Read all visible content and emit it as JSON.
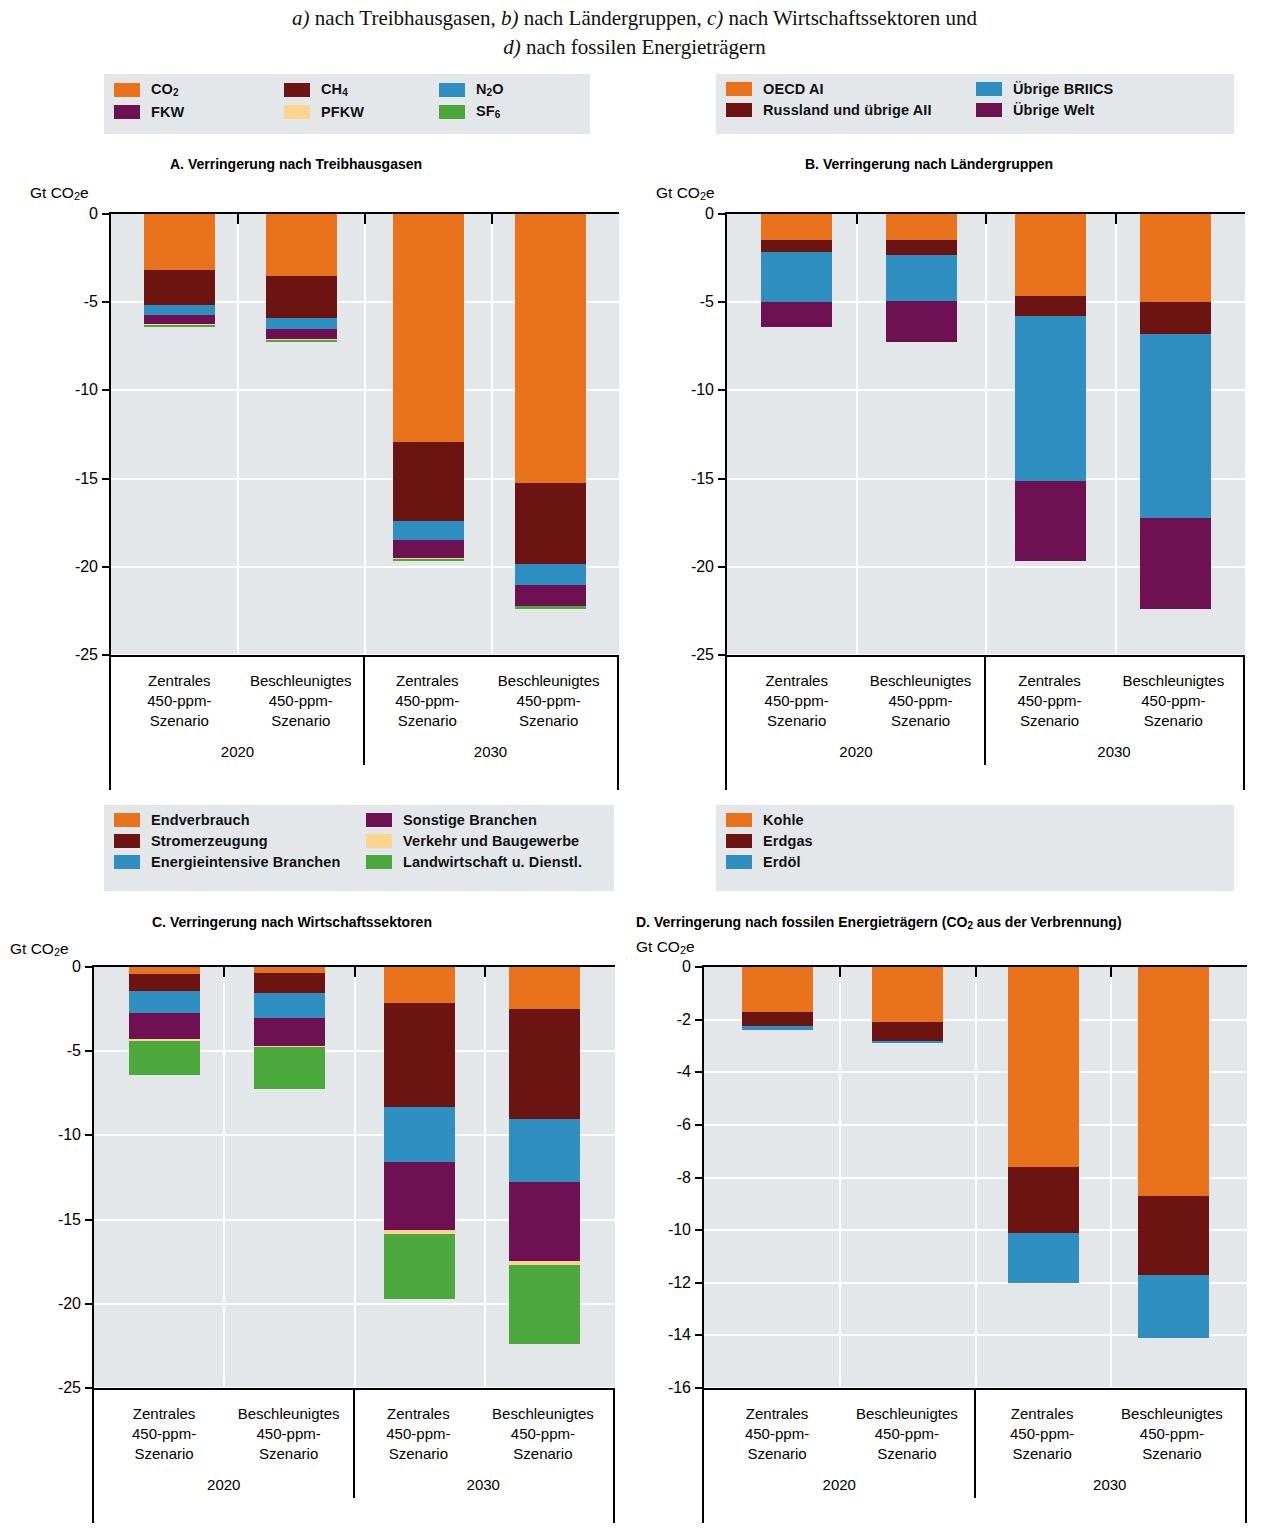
{
  "caption": {
    "line1_a": "a)",
    "line1_b": " nach Treibhausgasen, ",
    "line1_c": "b)",
    "line1_d": " nach Ländergruppen, ",
    "line1_e": "c)",
    "line1_f": " nach Wirtschaftssektoren und",
    "line2_a": "d)",
    "line2_b": " nach fossilen Energieträgern"
  },
  "colors": {
    "orange": "#E8731C",
    "darkred": "#6B1411",
    "blue": "#2F8FC0",
    "purple": "#6E1153",
    "peach": "#FBD490",
    "green": "#4CA83C",
    "plot_bg": "#E4E7E9",
    "grid": "#FFFFFF",
    "axis": "#000000"
  },
  "legends": {
    "ghg": {
      "items": [
        {
          "label": "CO",
          "sub": "2",
          "color_key": "orange",
          "name": "co2"
        },
        {
          "label": "CH",
          "sub": "4",
          "color_key": "darkred",
          "name": "ch4"
        },
        {
          "label": "N",
          "sub": "2",
          "label2": "O",
          "color_key": "blue",
          "name": "n2o"
        },
        {
          "label": "FKW",
          "sub": "",
          "color_key": "purple",
          "name": "fkw"
        },
        {
          "label": "PFKW",
          "sub": "",
          "color_key": "peach",
          "name": "pfkw"
        },
        {
          "label": "SF",
          "sub": "6",
          "color_key": "green",
          "name": "sf6"
        }
      ]
    },
    "regions": {
      "items": [
        {
          "label": "OECD AI",
          "color_key": "orange",
          "name": "oecd-ai"
        },
        {
          "label": "Russland und übrige AII",
          "color_key": "darkred",
          "name": "russland-uebrige-aii"
        },
        {
          "label": "Übrige BRIICS",
          "color_key": "blue",
          "name": "uebrige-briics"
        },
        {
          "label": "Übrige Welt",
          "color_key": "purple",
          "name": "uebrige-welt"
        }
      ]
    },
    "sectors": {
      "items": [
        {
          "label": "Endverbrauch",
          "color_key": "orange",
          "name": "endverbrauch"
        },
        {
          "label": "Stromerzeugung",
          "color_key": "darkred",
          "name": "stromerzeugung"
        },
        {
          "label": "Energieintensive Branchen",
          "color_key": "blue",
          "name": "energieintensive-branchen"
        },
        {
          "label": "Sonstige Branchen",
          "color_key": "purple",
          "name": "sonstige-branchen"
        },
        {
          "label": "Verkehr und Baugewerbe",
          "color_key": "peach",
          "name": "verkehr-und-baugewerbe"
        },
        {
          "label": "Landwirtschaft u. Dienstl.",
          "color_key": "green",
          "name": "landwirtschaft-u-dienstl"
        }
      ]
    },
    "fuels": {
      "items": [
        {
          "label": "Kohle",
          "color_key": "orange",
          "name": "kohle"
        },
        {
          "label": "Erdgas",
          "color_key": "darkred",
          "name": "erdgas"
        },
        {
          "label": "Erdöl",
          "color_key": "blue",
          "name": "erdoel"
        }
      ]
    }
  },
  "axis_unit": "Gt CO",
  "axis_unit_sub": "2",
  "axis_unit_tail": "e",
  "scenario_labels": [
    "Zentrales\n450-ppm-\nSzenario",
    "Beschleunigtes\n450-ppm-\nSzenario"
  ],
  "group_labels": [
    "2020",
    "2030"
  ],
  "panels": {
    "A": {
      "title": "A. Verringerung nach Treibhausgasen"
    },
    "B": {
      "title": "B. Verringerung nach Ländergruppen"
    },
    "C": {
      "title": "C. Verringerung nach Wirtschaftssektoren"
    },
    "D": {
      "title_a": "D. Verringerung nach fossilen Energieträgern (CO",
      "title_sub": "2",
      "title_b": " aus der Verbrennung)"
    }
  },
  "chart_data": [
    {
      "id": "A",
      "type": "bar",
      "stacked": true,
      "title": "A. Verringerung nach Treibhausgasen",
      "ylabel": "Gt CO2e",
      "ylim": [
        -25,
        0
      ],
      "yticks": [
        0,
        -5,
        -10,
        -15,
        -20,
        -25
      ],
      "ytick_labels": [
        "0",
        "-5",
        "-10",
        "-15",
        "-20",
        "-25"
      ],
      "grid": true,
      "categories": [
        "Zentrales 450-ppm-Szenario",
        "Beschleunigtes 450-ppm-Szenario",
        "Zentrales 450-ppm-Szenario",
        "Beschleunigtes 450-ppm-Szenario"
      ],
      "groups": [
        "2020",
        "2020",
        "2030",
        "2030"
      ],
      "series": [
        {
          "name": "CO2",
          "color": "#E8731C",
          "values": [
            -3.15,
            -3.5,
            -12.95,
            -15.25
          ]
        },
        {
          "name": "CH4",
          "color": "#6B1411",
          "values": [
            -2.0,
            -2.4,
            -4.45,
            -4.6
          ]
        },
        {
          "name": "N2O",
          "color": "#2F8FC0",
          "values": [
            -0.55,
            -0.6,
            -1.1,
            -1.2
          ]
        },
        {
          "name": "FKW",
          "color": "#6E1153",
          "values": [
            -0.55,
            -0.6,
            -1.0,
            -1.15
          ]
        },
        {
          "name": "PFKW",
          "color": "#FBD490",
          "values": [
            -0.03,
            -0.03,
            -0.04,
            -0.05
          ]
        },
        {
          "name": "SF6",
          "color": "#4CA83C",
          "values": [
            -0.12,
            -0.12,
            -0.16,
            -0.15
          ]
        }
      ],
      "totals": [
        -6.4,
        -7.25,
        -19.7,
        -22.4
      ]
    },
    {
      "id": "B",
      "type": "bar",
      "stacked": true,
      "title": "B. Verringerung nach Ländergruppen",
      "ylabel": "Gt CO2e",
      "ylim": [
        -25,
        0
      ],
      "yticks": [
        0,
        -5,
        -10,
        -15,
        -20,
        -25
      ],
      "ytick_labels": [
        "0",
        "-5",
        "-10",
        "-15",
        "-20",
        "-25"
      ],
      "grid": true,
      "categories": [
        "Zentrales 450-ppm-Szenario",
        "Beschleunigtes 450-ppm-Szenario",
        "Zentrales 450-ppm-Szenario",
        "Beschleunigtes 450-ppm-Szenario"
      ],
      "groups": [
        "2020",
        "2020",
        "2030",
        "2030"
      ],
      "series": [
        {
          "name": "OECD AI",
          "color": "#E8731C",
          "values": [
            -1.45,
            -1.5,
            -4.65,
            -5.0
          ]
        },
        {
          "name": "Russland und übrige AII",
          "color": "#6B1411",
          "values": [
            -0.7,
            -0.8,
            -1.15,
            -1.8
          ]
        },
        {
          "name": "Übrige BRIICS",
          "color": "#2F8FC0",
          "values": [
            -2.85,
            -2.65,
            -9.35,
            -10.45
          ]
        },
        {
          "name": "Übrige Welt",
          "color": "#6E1153",
          "values": [
            -1.4,
            -2.3,
            -4.55,
            -5.15
          ]
        }
      ],
      "totals": [
        -6.4,
        -7.25,
        -19.7,
        -22.4
      ]
    },
    {
      "id": "C",
      "type": "bar",
      "stacked": true,
      "title": "C. Verringerung nach Wirtschaftssektoren",
      "ylabel": "Gt CO2e",
      "ylim": [
        -25,
        0
      ],
      "yticks": [
        0,
        -5,
        -10,
        -15,
        -20,
        -25
      ],
      "ytick_labels": [
        "0",
        "-5",
        "-10",
        "-15",
        "-20",
        "-25"
      ],
      "grid": true,
      "categories": [
        "Zentrales 450-ppm-Szenario",
        "Beschleunigtes 450-ppm-Szenario",
        "Zentrales 450-ppm-Szenario",
        "Beschleunigtes 450-ppm-Szenario"
      ],
      "groups": [
        "2020",
        "2020",
        "2030",
        "2030"
      ],
      "series": [
        {
          "name": "Endverbrauch",
          "color": "#E8731C",
          "values": [
            -0.4,
            -0.35,
            -2.15,
            -2.5
          ]
        },
        {
          "name": "Stromerzeugung",
          "color": "#6B1411",
          "values": [
            -1.0,
            -1.2,
            -6.15,
            -6.55
          ]
        },
        {
          "name": "Energieintensive Branchen",
          "color": "#2F8FC0",
          "values": [
            -1.35,
            -1.5,
            -3.3,
            -3.7
          ]
        },
        {
          "name": "Sonstige Branchen",
          "color": "#6E1153",
          "values": [
            -1.55,
            -1.65,
            -4.0,
            -4.7
          ]
        },
        {
          "name": "Verkehr und Baugewerbe",
          "color": "#FBD490",
          "values": [
            -0.08,
            -0.08,
            -0.25,
            -0.25
          ]
        },
        {
          "name": "Landwirtschaft u. Dienstl.",
          "color": "#4CA83C",
          "values": [
            -2.02,
            -2.47,
            -3.85,
            -4.7
          ]
        }
      ],
      "totals": [
        -6.4,
        -7.25,
        -19.7,
        -22.4
      ]
    },
    {
      "id": "D",
      "type": "bar",
      "stacked": true,
      "title": "D. Verringerung nach fossilen Energieträgern (CO2 aus der Verbrennung)",
      "ylabel": "Gt CO2e",
      "ylim": [
        -16,
        0
      ],
      "yticks": [
        0,
        -2,
        -4,
        -6,
        -8,
        -10,
        -12,
        -14,
        -16
      ],
      "ytick_labels": [
        "0",
        "-2",
        "-4",
        "-6",
        "-8",
        "-10",
        "-12",
        "-14",
        "-16"
      ],
      "grid": true,
      "categories": [
        "Zentrales 450-ppm-Szenario",
        "Beschleunigtes 450-ppm-Szenario",
        "Zentrales 450-ppm-Szenario",
        "Beschleunigtes 450-ppm-Szenario"
      ],
      "groups": [
        "2020",
        "2020",
        "2030",
        "2030"
      ],
      "series": [
        {
          "name": "Kohle",
          "color": "#E8731C",
          "values": [
            -1.7,
            -2.1,
            -7.6,
            -8.7
          ]
        },
        {
          "name": "Erdgas",
          "color": "#6B1411",
          "values": [
            -0.55,
            -0.7,
            -2.5,
            -3.0
          ]
        },
        {
          "name": "Erdöl",
          "color": "#2F8FC0",
          "values": [
            -0.15,
            -0.1,
            -1.9,
            -2.4
          ]
        }
      ],
      "totals": [
        -2.4,
        -2.9,
        -12.0,
        -14.1
      ]
    }
  ]
}
